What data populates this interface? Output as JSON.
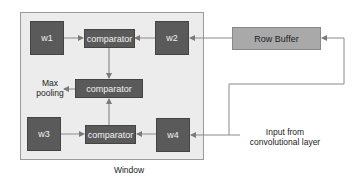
{
  "diagram": {
    "window_label": "Window",
    "blocks": {
      "w1": "w1",
      "w2": "w2",
      "w3": "w3",
      "w4": "w4",
      "comparator_top": "comparator",
      "comparator_middle": "comparator",
      "comparator_bottom": "comparator",
      "row_buffer": "Row Buffer"
    },
    "labels": {
      "max_pooling_line1": "Max",
      "max_pooling_line2": "pooling",
      "input_line1": "Input from",
      "input_line2": "convolutional layer"
    },
    "colors": {
      "block_dark": "#5a5a5a",
      "row_buffer": "#a9a9a9",
      "window_bg": "#ececec",
      "wire": "#8a8a8a"
    }
  }
}
